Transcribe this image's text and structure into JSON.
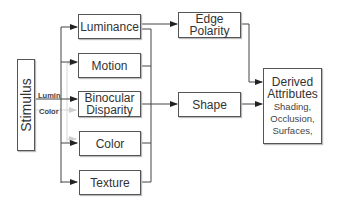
{
  "diagram": {
    "stimulus": "Stimulus",
    "input_labels": {
      "lumin": "Lumin",
      "color": "Color"
    },
    "channels": [
      {
        "id": "luminance",
        "label": "Luminance"
      },
      {
        "id": "motion",
        "label": "Motion"
      },
      {
        "id": "binocular",
        "label_line1": "Binocular",
        "label_line2": "Disparity"
      },
      {
        "id": "color",
        "label": "Color"
      },
      {
        "id": "texture",
        "label": "Texture"
      }
    ],
    "edge_polarity": {
      "line1": "Edge",
      "line2": "Polarity"
    },
    "shape": {
      "label": "Shape"
    },
    "derived": {
      "line1": "Derived",
      "line2": "Attributes",
      "items": [
        "Shading,",
        "Occlusion,",
        "Surfaces,"
      ]
    },
    "colors": {
      "line": "#444444",
      "gray_arrow": "#c8c8c8",
      "border": "#555555"
    }
  }
}
